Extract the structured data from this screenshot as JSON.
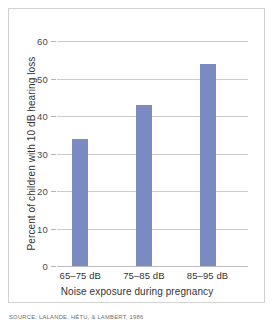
{
  "chart_data": {
    "type": "bar",
    "title": "",
    "categories": [
      "65–75 dB",
      "75–85 dB",
      "85–95 dB"
    ],
    "values": [
      34,
      43,
      54
    ],
    "xlabel": "Noise exposure during pregnancy",
    "ylabel": "Percent of children with 10 dB hearing loss",
    "ylim": [
      0,
      60
    ],
    "yticks": [
      0,
      10,
      20,
      30,
      40,
      50,
      60
    ],
    "ytick_labels": [
      "0",
      "10",
      "20",
      "30",
      "40",
      "50",
      "60"
    ],
    "grid": true,
    "legend": false,
    "bar_color": "#7b8ac0",
    "gridline_color": "#c9ccd4",
    "frame_color": "#d2d2d2",
    "background_color": "#ffffff"
  },
  "source": {
    "credit": "SOURCE: LALANDE, HÉTU, & LAMBERT, 1986"
  }
}
